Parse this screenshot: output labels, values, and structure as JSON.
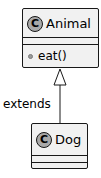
{
  "diagram": {
    "type": "uml-class-diagram",
    "classes": [
      {
        "id": "animal",
        "stereotype_icon": "C",
        "name": "Animal",
        "fields": [],
        "methods": [
          {
            "visibility": "package-private",
            "signature": "eat()"
          }
        ]
      },
      {
        "id": "dog",
        "stereotype_icon": "C",
        "name": "Dog",
        "fields": [],
        "methods": []
      }
    ],
    "relations": [
      {
        "from": "dog",
        "to": "animal",
        "kind": "generalization",
        "label": "extends"
      }
    ],
    "colors": {
      "box_fill": "#f1f1f1",
      "box_border": "#181818",
      "icon_fill": "#a9a9a9",
      "line": "#181818"
    }
  }
}
